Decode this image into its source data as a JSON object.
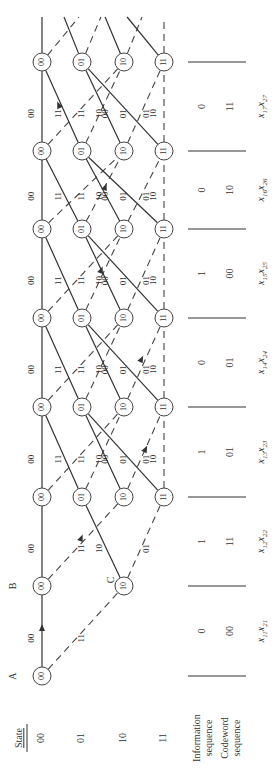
{
  "figure": {
    "orientation": "rotated-90-ccw",
    "header": {
      "state_title": "State"
    },
    "states": [
      "00",
      "01",
      "10",
      "11"
    ],
    "node_labels": {
      "A": "A",
      "B": "B",
      "C": "C"
    },
    "row_labels": {
      "information": "Information sequence",
      "information_line1": "Information",
      "information_line2": "sequence",
      "codeword_line1": "Codeword",
      "codeword_line2": "sequence"
    },
    "stages": [
      {
        "info": "0",
        "codeword": "00",
        "symbol": "x11x21",
        "symbol_main": "x",
        "sub1": "11",
        "sub2": "21"
      },
      {
        "info": "1",
        "codeword": "11",
        "symbol": "x12x22",
        "symbol_main": "x",
        "sub1": "12",
        "sub2": "22"
      },
      {
        "info": "1",
        "codeword": "01",
        "symbol": "x13x23",
        "symbol_main": "x",
        "sub1": "13",
        "sub2": "23"
      },
      {
        "info": "0",
        "codeword": "01",
        "symbol": "x14x24",
        "symbol_main": "x",
        "sub1": "14",
        "sub2": "24"
      },
      {
        "info": "1",
        "codeword": "00",
        "symbol": "x15x25",
        "symbol_main": "x",
        "sub1": "15",
        "sub2": "25"
      },
      {
        "info": "0",
        "codeword": "10",
        "symbol": "x16x26",
        "symbol_main": "x",
        "sub1": "16",
        "sub2": "26"
      },
      {
        "info": "0",
        "codeword": "11",
        "symbol": "x17x27",
        "symbol_main": "x",
        "sub1": "17",
        "sub2": "27"
      }
    ],
    "branch_labels": {
      "s00_to_00": "00",
      "s00_to_10": "11",
      "s01_to_00": "11",
      "s01_to_10": "00",
      "s10_to_01": "10",
      "s10_to_11": "01",
      "s11_to_01": "01",
      "s11_to_11": "10"
    },
    "legend": {
      "solid": "input 0",
      "dashed": "input 1"
    },
    "colors": {
      "line": "#333333",
      "text": "#333333",
      "background": "#ffffff",
      "highlight_label": "#3a3a8c"
    }
  }
}
